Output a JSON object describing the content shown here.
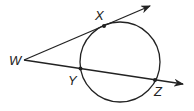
{
  "diagram": {
    "type": "geometry-tangent-secant",
    "labels": {
      "W": "W",
      "X": "X",
      "Y": "Y",
      "Z": "Z"
    },
    "colors": {
      "stroke": "#222222",
      "background": "#ffffff"
    }
  }
}
